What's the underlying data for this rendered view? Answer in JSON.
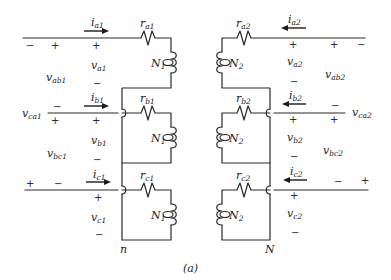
{
  "figure": {
    "caption": "(a)"
  },
  "winding1": {
    "neutral_label": "n",
    "phases": [
      {
        "phase": "a",
        "current": {
          "base": "i",
          "sub": "a1",
          "direction": "right"
        },
        "resistor": {
          "base": "r",
          "sub": "a1"
        },
        "coil": {
          "base": "N",
          "sub": "1"
        },
        "voltage": {
          "base": "v",
          "sub": "a1"
        }
      },
      {
        "phase": "b",
        "current": {
          "base": "i",
          "sub": "b1",
          "direction": "right"
        },
        "resistor": {
          "base": "r",
          "sub": "b1"
        },
        "coil": {
          "base": "N",
          "sub": "1"
        },
        "voltage": {
          "base": "v",
          "sub": "b1"
        }
      },
      {
        "phase": "c",
        "current": {
          "base": "i",
          "sub": "c1",
          "direction": "right"
        },
        "resistor": {
          "base": "r",
          "sub": "c1"
        },
        "coil": {
          "base": "N",
          "sub": "1"
        },
        "voltage": {
          "base": "v",
          "sub": "c1"
        }
      }
    ],
    "line_voltages": [
      {
        "base": "v",
        "sub": "ab1"
      },
      {
        "base": "v",
        "sub": "ca1"
      },
      {
        "base": "v",
        "sub": "bc1"
      }
    ]
  },
  "winding2": {
    "neutral_label": "N",
    "phases": [
      {
        "phase": "a",
        "current": {
          "base": "i",
          "sub": "a2",
          "direction": "left"
        },
        "resistor": {
          "base": "r",
          "sub": "a2"
        },
        "coil": {
          "base": "N",
          "sub": "2"
        },
        "voltage": {
          "base": "v",
          "sub": "a2"
        }
      },
      {
        "phase": "b",
        "current": {
          "base": "i",
          "sub": "b2",
          "direction": "left"
        },
        "resistor": {
          "base": "r",
          "sub": "b2"
        },
        "coil": {
          "base": "N",
          "sub": "2"
        },
        "voltage": {
          "base": "v",
          "sub": "b2"
        }
      },
      {
        "phase": "c",
        "current": {
          "base": "i",
          "sub": "c2",
          "direction": "left"
        },
        "resistor": {
          "base": "r",
          "sub": "c2"
        },
        "coil": {
          "base": "N",
          "sub": "2"
        },
        "voltage": {
          "base": "v",
          "sub": "c2"
        }
      }
    ],
    "line_voltages": [
      {
        "base": "v",
        "sub": "ab2"
      },
      {
        "base": "v",
        "sub": "ca2"
      },
      {
        "base": "v",
        "sub": "bc2"
      }
    ]
  },
  "signs": {
    "plus": "+",
    "minus": "−"
  }
}
